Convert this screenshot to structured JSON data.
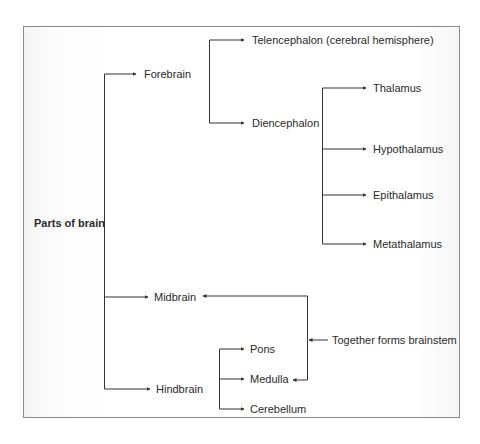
{
  "diagram": {
    "root": {
      "label": "Parts of brain"
    },
    "level1": [
      {
        "id": "forebrain",
        "label": "Forebrain"
      },
      {
        "id": "midbrain",
        "label": "Midbrain"
      },
      {
        "id": "hindbrain",
        "label": "Hindbrain"
      }
    ],
    "forebrain_children": [
      {
        "id": "telencephalon",
        "label": "Telencephalon (cerebral hemisphere)"
      },
      {
        "id": "diencephalon",
        "label": "Diencephalon"
      }
    ],
    "diencephalon_children": [
      {
        "id": "thalamus",
        "label": "Thalamus"
      },
      {
        "id": "hypothalamus",
        "label": "Hypothalamus"
      },
      {
        "id": "epithalamus",
        "label": "Epithalamus"
      },
      {
        "id": "metathalamus",
        "label": "Metathalamus"
      }
    ],
    "hindbrain_children": [
      {
        "id": "pons",
        "label": "Pons"
      },
      {
        "id": "medulla",
        "label": "Medulla"
      },
      {
        "id": "cerebellum",
        "label": "Cerebellum"
      }
    ],
    "annotation": {
      "label": "Together forms brainstem",
      "links": [
        "Midbrain",
        "Medulla"
      ]
    },
    "colors": {
      "line": "#333333",
      "text": "#2a2a2a",
      "border": "#8a8a8a"
    }
  }
}
